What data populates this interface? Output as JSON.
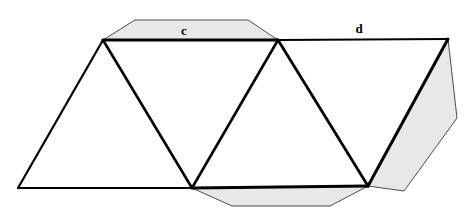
{
  "figure": {
    "canvas": {
      "width": 469,
      "height": 214,
      "background": "#ffffff"
    },
    "colors": {
      "tab_fill": "#e8e8e8",
      "tab_stroke": "#4d4d4d",
      "face_fill": "#ffffff",
      "edge_stroke": "#000000",
      "label_color": "#000000"
    },
    "labels": [
      {
        "id": "label-c",
        "text": "c",
        "x": 184,
        "y": 35
      },
      {
        "id": "label-d",
        "text": "d",
        "x": 359,
        "y": 33
      }
    ],
    "vertices": {
      "apex_left": {
        "x": 103,
        "y": 40
      },
      "apex_middle": {
        "x": 278,
        "y": 40
      },
      "corner_topright": {
        "x": 448,
        "y": 39
      },
      "base_left": {
        "x": 18,
        "y": 188
      },
      "base_middle": {
        "x": 192,
        "y": 188
      },
      "base_right": {
        "x": 368,
        "y": 186
      }
    },
    "tabs": [
      {
        "id": "tab-top",
        "name": "top-glue-tab",
        "points": "103,40 135,20 248,20 278,40"
      },
      {
        "id": "tab-bottom",
        "name": "bottom-glue-tab",
        "points": "192,188 232,206 330,206 368,186"
      },
      {
        "id": "tab-right",
        "name": "right-glue-tab",
        "points": "448,39 457,118 404,191 368,186"
      }
    ],
    "faces": [
      {
        "id": "face-1",
        "name": "triangle-face-left",
        "points": "18,188 103,40 192,188"
      },
      {
        "id": "face-2",
        "name": "triangle-face-second",
        "points": "103,40 278,40 192,188"
      },
      {
        "id": "face-3",
        "name": "triangle-face-third",
        "points": "192,188 278,40 368,186"
      },
      {
        "id": "face-4",
        "name": "triangle-face-right",
        "points": "278,40 448,39 368,186"
      }
    ],
    "edges": [
      {
        "id": "edge-top-c",
        "name": "edge-c",
        "x1": 103,
        "y1": 40,
        "x2": 278,
        "y2": 40,
        "width": 3.0
      },
      {
        "id": "edge-top-d",
        "name": "edge-d",
        "x1": 278,
        "y1": 40,
        "x2": 448,
        "y2": 39,
        "width": 2.0
      },
      {
        "id": "edge-base-left",
        "name": "edge-base-left",
        "x1": 18,
        "y1": 188,
        "x2": 192,
        "y2": 188,
        "width": 2.2
      },
      {
        "id": "edge-base-right",
        "name": "edge-base-right",
        "x1": 192,
        "y1": 188,
        "x2": 368,
        "y2": 186,
        "width": 2.8
      },
      {
        "id": "edge-left-slant",
        "name": "edge-left-slant",
        "x1": 18,
        "y1": 188,
        "x2": 103,
        "y2": 40,
        "width": 2.2
      },
      {
        "id": "edge-diag-1",
        "name": "edge-fold-one",
        "x1": 103,
        "y1": 40,
        "x2": 192,
        "y2": 188,
        "width": 2.6
      },
      {
        "id": "edge-diag-2",
        "name": "edge-fold-two",
        "x1": 192,
        "y1": 188,
        "x2": 278,
        "y2": 40,
        "width": 2.6
      },
      {
        "id": "edge-diag-3",
        "name": "edge-fold-three",
        "x1": 278,
        "y1": 40,
        "x2": 368,
        "y2": 186,
        "width": 2.8
      },
      {
        "id": "edge-right-slant",
        "name": "edge-right-slant",
        "x1": 368,
        "y1": 186,
        "x2": 448,
        "y2": 39,
        "width": 3.0
      }
    ]
  }
}
